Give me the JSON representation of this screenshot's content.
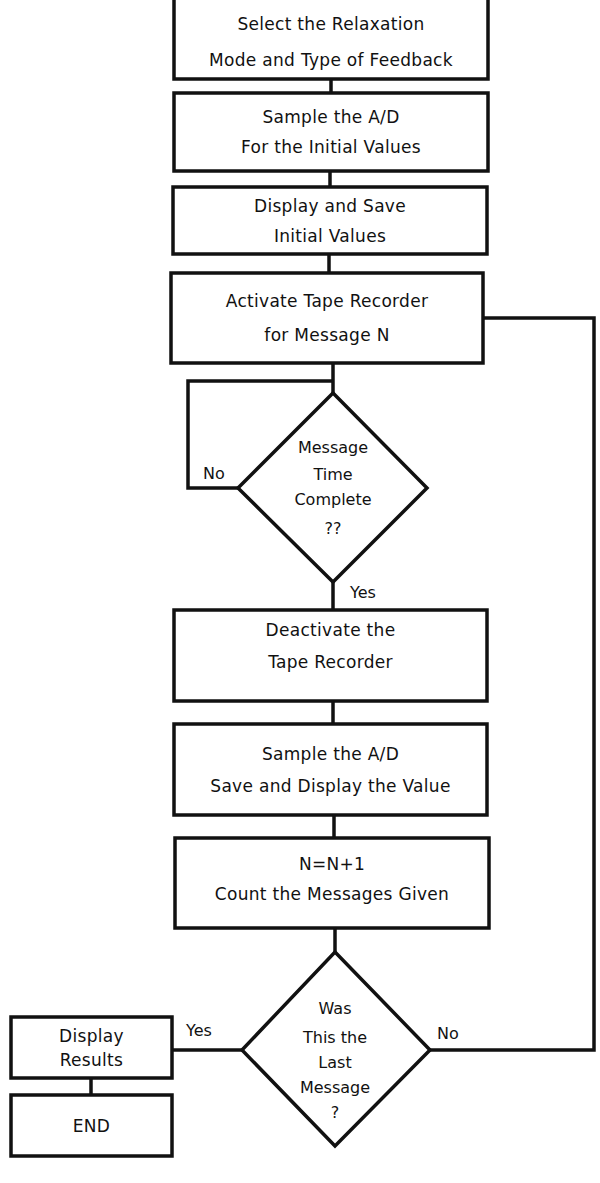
{
  "diagram": {
    "type": "flowchart",
    "stroke_color": "#111111",
    "background": "#ffffff",
    "nodes": {
      "select_mode": {
        "shape": "process",
        "lines": [
          "Select the Relaxation",
          "Mode and Type of Feedback"
        ]
      },
      "sample_initial": {
        "shape": "process",
        "lines": [
          "Sample the A/D",
          "For the Initial Values"
        ]
      },
      "display_initial": {
        "shape": "process",
        "lines": [
          "Display and Save",
          "Initial Values"
        ]
      },
      "activate_recorder": {
        "shape": "process",
        "lines": [
          "Activate Tape Recorder",
          "for Message N"
        ]
      },
      "time_complete": {
        "shape": "decision",
        "lines": [
          "Message",
          "Time",
          "Complete",
          "??"
        ]
      },
      "deactivate_recorder": {
        "shape": "process",
        "lines": [
          "Deactivate the",
          "Tape Recorder"
        ]
      },
      "sample_value": {
        "shape": "process",
        "lines": [
          "Sample the A/D",
          "Save and Display the Value"
        ]
      },
      "count_messages": {
        "shape": "process",
        "lines": [
          "N=N+1",
          "Count the Messages Given"
        ]
      },
      "last_message": {
        "shape": "decision",
        "lines": [
          "Was",
          "This the",
          "Last",
          "Message",
          "?"
        ]
      },
      "display_results": {
        "shape": "process",
        "lines": [
          "Display",
          "Results"
        ]
      },
      "end": {
        "shape": "terminal",
        "lines": [
          "END"
        ]
      }
    },
    "edges": [
      {
        "from": "select_mode",
        "to": "sample_initial",
        "label": ""
      },
      {
        "from": "sample_initial",
        "to": "display_initial",
        "label": ""
      },
      {
        "from": "display_initial",
        "to": "activate_recorder",
        "label": ""
      },
      {
        "from": "activate_recorder",
        "to": "time_complete",
        "label": ""
      },
      {
        "from": "time_complete",
        "to": "time_complete",
        "label": "No"
      },
      {
        "from": "time_complete",
        "to": "deactivate_recorder",
        "label": "Yes"
      },
      {
        "from": "deactivate_recorder",
        "to": "sample_value",
        "label": ""
      },
      {
        "from": "sample_value",
        "to": "count_messages",
        "label": ""
      },
      {
        "from": "count_messages",
        "to": "last_message",
        "label": ""
      },
      {
        "from": "last_message",
        "to": "display_results",
        "label": "Yes"
      },
      {
        "from": "last_message",
        "to": "activate_recorder",
        "label": "No"
      },
      {
        "from": "display_results",
        "to": "end",
        "label": ""
      }
    ],
    "labels": {
      "time_no": "No",
      "time_yes": "Yes",
      "last_yes": "Yes",
      "last_no": "No"
    }
  }
}
